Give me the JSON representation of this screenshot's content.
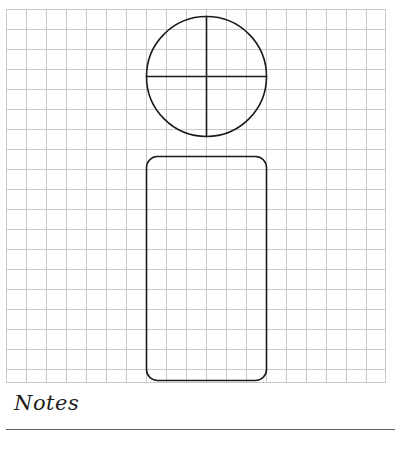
{
  "page": {
    "background_color": "#ffffff",
    "width": 407,
    "height": 452
  },
  "grid": {
    "name": "graph-paper-grid",
    "line_color": "#c9c9c9",
    "cell_size_px": 20,
    "left": 6,
    "top": 9,
    "width": 380,
    "height": 374,
    "columns": 19,
    "rows": 19
  },
  "drawing": {
    "stroke_color": "#1a1a1a",
    "stroke_width": 1.6,
    "fill": "none",
    "shapes": [
      {
        "name": "circle-head",
        "type": "circle",
        "cx": 206.5,
        "cy": 76.5,
        "r": 60,
        "label": "circle"
      },
      {
        "name": "circle-vertical-diameter",
        "type": "line",
        "x1": 206.5,
        "y1": 16.5,
        "x2": 206.5,
        "y2": 136.5,
        "label": "vertical diameter"
      },
      {
        "name": "circle-horizontal-diameter",
        "type": "line",
        "x1": 146.5,
        "y1": 76.5,
        "x2": 266.5,
        "y2": 76.5,
        "label": "horizontal diameter"
      },
      {
        "name": "rounded-rectangle-body",
        "type": "rounded-rect",
        "x": 146.5,
        "y": 156.5,
        "width": 120,
        "height": 224,
        "rx": 11,
        "label": "rounded rectangle"
      }
    ]
  },
  "notes": {
    "label": "Notes",
    "rule_color": "#5d5d5d"
  }
}
